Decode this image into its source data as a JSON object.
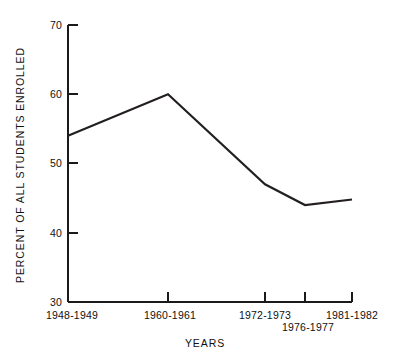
{
  "chart_data": {
    "type": "line",
    "title": "",
    "xlabel": "YEARS",
    "ylabel": "PERCENT OF ALL STUDENTS ENROLLED",
    "categories": [
      "1948-1949",
      "1960-1961",
      "1972-1973",
      "1976-1977",
      "1981-1982"
    ],
    "values": [
      54,
      60,
      47,
      44,
      44.8
    ],
    "series": [
      {
        "name": "Percent of all students enrolled",
        "values": [
          54,
          60,
          47,
          44,
          44.8
        ]
      }
    ],
    "ylim": [
      30,
      70
    ],
    "ytick_labels": [
      "30",
      "40",
      "50",
      "60",
      "70"
    ],
    "ytick_values": [
      30,
      40,
      50,
      60,
      70
    ],
    "xtick_labels": [
      "1948-1949",
      "1960-1961",
      "1972-1973",
      "1976-1977",
      "1981-1982"
    ],
    "grid": false,
    "legend": false,
    "legend_position": "none",
    "line_color": "#231f20",
    "axis_color": "#1a1a1a",
    "background_color": "#ffffff",
    "x_pixel_positions": [
      68,
      168,
      265,
      305,
      352
    ],
    "xtick_label_rows": [
      0,
      0,
      0,
      1,
      0
    ]
  },
  "axes": {
    "y_title": "PERCENT OF ALL STUDENTS ENROLLED",
    "x_title": "YEARS"
  },
  "yticks": [
    {
      "label": "70",
      "value": 70
    },
    {
      "label": "60",
      "value": 60
    },
    {
      "label": "50",
      "value": 50
    },
    {
      "label": "40",
      "value": 40
    },
    {
      "label": "30",
      "value": 30
    }
  ],
  "xticks": [
    {
      "label": "1948-1949",
      "row": 0
    },
    {
      "label": "1960-1961",
      "row": 0
    },
    {
      "label": "1972-1973",
      "row": 0
    },
    {
      "label": "1976-1977",
      "row": 1
    },
    {
      "label": "1981-1982",
      "row": 0
    }
  ]
}
